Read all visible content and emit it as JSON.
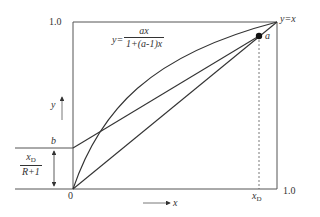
{
  "diagram": {
    "type": "mccabe-thiele-q-line-construction",
    "labels": {
      "y_top": "1.0",
      "x_right": "1.0",
      "origin": "0",
      "y_axis": "y",
      "x_axis": "x",
      "diagonal": "y=x",
      "point_a": "a",
      "intercept_b": "b",
      "x_d": "x",
      "x_d_sub": "D",
      "intercept_num": "x",
      "intercept_num_sub": "D",
      "intercept_den": "R+1",
      "equilibrium_lhs": "y=",
      "equilibrium_num": "ax",
      "equilibrium_den": "1+(a-1)x"
    },
    "curves": [
      {
        "name": "equilibrium-curve",
        "equation": "y = ax/(1+(a-1)x)"
      },
      {
        "name": "diagonal",
        "equation": "y = x"
      },
      {
        "name": "operating-line",
        "from": "b",
        "to": "a"
      }
    ],
    "stroke_color": "#333333"
  }
}
